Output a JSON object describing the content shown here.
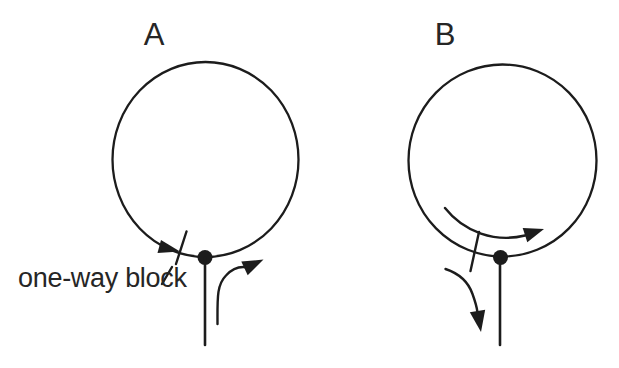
{
  "panels": {
    "a": {
      "label": "A"
    },
    "b": {
      "label": "B"
    }
  },
  "annotations": {
    "block_label": "one-way block"
  },
  "colors": {
    "line": "#1c1c1c",
    "text": "#262626",
    "background": "#ffffff"
  }
}
